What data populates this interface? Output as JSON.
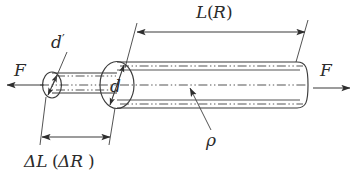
{
  "figure": {
    "name": "stressed-cylindrical-rod-diagram",
    "background_color": "#ffffff",
    "line_color": "#3b3b3b",
    "labels": {
      "length": "L",
      "length_paren_open": "(",
      "length_resistance": "R",
      "length_paren_close": ")",
      "force_left": "F",
      "force_right": "F",
      "diameter_large": "d",
      "diameter_small": "d",
      "diameter_small_prime": "′",
      "resistivity": "ρ",
      "delta_length": "ΔL",
      "delta_paren_open": "(",
      "delta_resistance": "ΔR",
      "delta_paren_close": ")"
    }
  }
}
